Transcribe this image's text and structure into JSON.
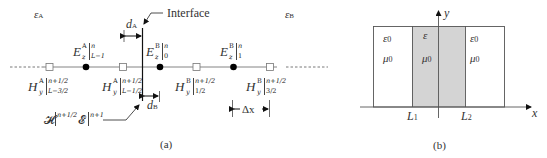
{
  "panel_a": {
    "caption": "(a)",
    "region_left_label": "ε",
    "region_left_sub": "A",
    "region_right_label": "ε",
    "region_right_sub": "B",
    "interface_label": "Interface",
    "d_A": {
      "symbol": "d",
      "sub": "A"
    },
    "d_B": {
      "symbol": "d",
      "sub": "B"
    },
    "delta_x": "Δx",
    "e_fields": [
      {
        "base": "E",
        "sub": "z",
        "sup": "A",
        "bar_sup": "n",
        "bar_sub": "L−1"
      },
      {
        "base": "E",
        "sub": "z",
        "sup": "B",
        "bar_sup": "n",
        "bar_sub": "0"
      },
      {
        "base": "E",
        "sub": "z",
        "sup": "B",
        "bar_sup": "n",
        "bar_sub": "1"
      }
    ],
    "h_fields": [
      {
        "base": "H",
        "sub": "y",
        "sup": "A",
        "bar_sup": "n+1/2",
        "bar_sub": "L−3/2"
      },
      {
        "base": "H",
        "sub": "y",
        "sup": "A",
        "bar_sup": "n+1/2",
        "bar_sub": "L−1/2"
      },
      {
        "base": "H",
        "sub": "y",
        "sup": "B",
        "bar_sup": "n+1/2",
        "bar_sub": "1/2"
      },
      {
        "base": "H",
        "sub": "y",
        "sup": "B",
        "bar_sup": "n+1/2",
        "bar_sub": "3/2"
      }
    ],
    "interface_fields": {
      "h": "𝓗",
      "h_sup": "n+1/2",
      "e": "𝓔",
      "e_sup": "n+1"
    }
  },
  "panel_b": {
    "caption": "(b)",
    "axis_x": "x",
    "axis_y": "y",
    "left_eps": "ε",
    "left_eps_sub": "0",
    "left_mu": "μ",
    "left_mu_sub": "0",
    "mid_eps": "ε",
    "mid_mu": "μ",
    "mid_mu_sub": "0",
    "right_eps": "ε",
    "right_eps_sub": "0",
    "right_mu": "μ",
    "right_mu_sub": "0",
    "L1": "L",
    "L1_sub": "1",
    "L2": "L",
    "L2_sub": "2",
    "colors": {
      "slab_fill": "#d4d4d4",
      "line": "#444444"
    }
  }
}
